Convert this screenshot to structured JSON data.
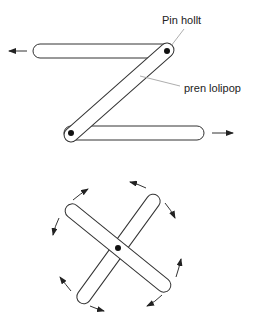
{
  "diagram": {
    "top_figure": {
      "labels": {
        "pin": "Pin hollt",
        "lollipop": "pren lolipop"
      },
      "parts": [
        "top-bar",
        "diagonal-bar",
        "bottom-bar",
        "upper-pin",
        "lower-pin"
      ],
      "arrows": [
        "left",
        "right"
      ]
    },
    "bottom_figure": {
      "parts": [
        "bar-nw-se",
        "bar-ne-sw",
        "center-pin"
      ],
      "arrows": 8,
      "motion": "rotation"
    },
    "colors": {
      "stroke": "#333333",
      "leader": "#999999",
      "pin": "#111111",
      "background": "#ffffff"
    }
  }
}
